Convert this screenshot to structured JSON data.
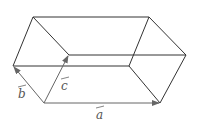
{
  "diagram": {
    "type": "parallelepiped",
    "vectors": [
      {
        "name": "a",
        "label": "a"
      },
      {
        "name": "b",
        "label": "b"
      },
      {
        "name": "c",
        "label": "c"
      }
    ],
    "colors": {
      "edge": "#333333",
      "vector": "#555555",
      "label": "#555555"
    }
  }
}
